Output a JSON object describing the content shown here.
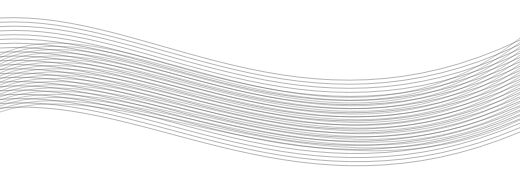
{
  "image": {
    "width": 520,
    "height": 194,
    "background": "#ffffff",
    "description": "Abstract wave of fine gray lines"
  },
  "wave_families": [
    {
      "name": "family-a",
      "count": 22,
      "stroke": "#6e6e6e",
      "opacity": 0.75,
      "stroke_width": 0.7,
      "start": {
        "x": 0,
        "y_top": 18,
        "y_bottom": 108
      },
      "c1": {
        "x": 150,
        "y_top": 10,
        "y_bottom": 95
      },
      "c2": {
        "x": 300,
        "y_top": 145,
        "y_bottom": 225
      },
      "end": {
        "x": 520,
        "y_top": 40,
        "y_bottom": 132
      }
    },
    {
      "name": "family-b",
      "count": 20,
      "stroke": "#5a5a5a",
      "opacity": 0.6,
      "stroke_width": 0.6,
      "start": {
        "x": 0,
        "y_top": 55,
        "y_bottom": 112
      },
      "c1": {
        "x": 120,
        "y_top": -5,
        "y_bottom": 70
      },
      "c2": {
        "x": 330,
        "y_top": 190,
        "y_bottom": 210
      },
      "end": {
        "x": 520,
        "y_top": 38,
        "y_bottom": 120
      }
    }
  ]
}
